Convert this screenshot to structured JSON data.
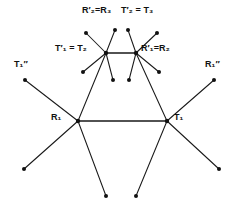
{
  "figure": {
    "background_color": "#ffffff",
    "line_color": "#1a1a1a",
    "node_color": "#111111",
    "width": 239,
    "height": 204
  },
  "labels": {
    "top_left": {
      "base": "R",
      "sub": "2",
      "prime": "′",
      "relation": "=",
      "rhs_base": "R",
      "rhs_sub": "3",
      "text": "R′₂=R₃"
    },
    "top_right": {
      "base": "T",
      "sub": "2",
      "prime": "′",
      "relation": "=",
      "rhs_base": "T",
      "rhs_sub": "3",
      "text": "T′₂ = T₃"
    },
    "mid_left": {
      "base": "T",
      "sub": "1",
      "prime": "′",
      "relation": "=",
      "rhs_base": "T",
      "rhs_sub": "2",
      "text": "T′₁ = T₂"
    },
    "mid_right": {
      "base": "R",
      "sub": "1",
      "prime": "′",
      "relation": "=",
      "rhs_base": "R",
      "rhs_sub": "2",
      "text": "R′₁=R₂"
    },
    "far_left": {
      "base": "T",
      "sub": "1",
      "prime": "″",
      "text": "T₁″"
    },
    "far_right": {
      "base": "R",
      "sub": "1",
      "prime": "″",
      "text": "R₁″"
    },
    "lower_left": {
      "base": "R",
      "sub": "1",
      "prime": "",
      "text": "R₁"
    },
    "lower_right": {
      "base": "T",
      "sub": "1",
      "prime": "",
      "text": "T₁"
    }
  },
  "chart_data": {
    "type": "diagram",
    "hubs": [
      {
        "id": "hub-upper-left",
        "x": 106,
        "y": 53,
        "label": "T′₁ = T₂"
      },
      {
        "id": "hub-upper-right",
        "x": 136,
        "y": 53,
        "label": "R′₁=R₂"
      },
      {
        "id": "hub-lower-left",
        "x": 78,
        "y": 121,
        "label": "R₁"
      },
      {
        "id": "hub-lower-right",
        "x": 167,
        "y": 121,
        "label": "T₁"
      }
    ],
    "leaves": [
      {
        "id": "leaf-ul-nw",
        "x": 86,
        "y": 33,
        "hub": "hub-upper-left"
      },
      {
        "id": "leaf-ul-n",
        "x": 115,
        "y": 30,
        "hub": "hub-upper-left"
      },
      {
        "id": "leaf-ul-sw",
        "x": 83,
        "y": 72,
        "hub": "hub-upper-left"
      },
      {
        "id": "leaf-ul-s",
        "x": 113,
        "y": 80,
        "hub": "hub-upper-left"
      },
      {
        "id": "leaf-ur-n",
        "x": 128,
        "y": 30,
        "hub": "hub-upper-right"
      },
      {
        "id": "leaf-ur-ne",
        "x": 157,
        "y": 33,
        "hub": "hub-upper-right"
      },
      {
        "id": "leaf-ur-s",
        "x": 129,
        "y": 80,
        "hub": "hub-upper-right"
      },
      {
        "id": "leaf-ur-se",
        "x": 159,
        "y": 72,
        "hub": "hub-upper-right"
      },
      {
        "id": "leaf-ll-nw",
        "x": 25,
        "y": 80,
        "hub": "hub-lower-left",
        "label": "T₁″"
      },
      {
        "id": "leaf-ll-sw",
        "x": 24,
        "y": 169,
        "hub": "hub-lower-left"
      },
      {
        "id": "leaf-ll-s",
        "x": 106,
        "y": 196,
        "hub": "hub-lower-left"
      },
      {
        "id": "leaf-lr-ne",
        "x": 214,
        "y": 80,
        "hub": "hub-lower-right",
        "label": "R₁″"
      },
      {
        "id": "leaf-lr-se",
        "x": 219,
        "y": 169,
        "hub": "hub-lower-right"
      },
      {
        "id": "leaf-lr-s",
        "x": 136,
        "y": 196,
        "hub": "hub-lower-right"
      }
    ],
    "edges": [
      {
        "from": "hub-upper-left",
        "to": "hub-upper-right",
        "kind": "spine"
      },
      {
        "from": "hub-lower-left",
        "to": "hub-lower-right",
        "kind": "spine"
      },
      {
        "from": "hub-lower-left",
        "to": "hub-upper-left",
        "kind": "normal"
      },
      {
        "from": "hub-lower-right",
        "to": "hub-upper-right",
        "kind": "normal"
      },
      {
        "from": "hub-upper-left",
        "to": "leaf-ul-nw",
        "kind": "normal"
      },
      {
        "from": "hub-upper-left",
        "to": "leaf-ul-n",
        "kind": "normal"
      },
      {
        "from": "hub-upper-left",
        "to": "leaf-ul-sw",
        "kind": "normal"
      },
      {
        "from": "hub-upper-left",
        "to": "leaf-ul-s",
        "kind": "normal"
      },
      {
        "from": "hub-upper-right",
        "to": "leaf-ur-n",
        "kind": "normal"
      },
      {
        "from": "hub-upper-right",
        "to": "leaf-ur-ne",
        "kind": "normal"
      },
      {
        "from": "hub-upper-right",
        "to": "leaf-ur-s",
        "kind": "normal"
      },
      {
        "from": "hub-upper-right",
        "to": "leaf-ur-se",
        "kind": "normal"
      },
      {
        "from": "hub-lower-left",
        "to": "leaf-ll-nw",
        "kind": "normal"
      },
      {
        "from": "hub-lower-left",
        "to": "leaf-ll-sw",
        "kind": "normal"
      },
      {
        "from": "hub-lower-left",
        "to": "leaf-ll-s",
        "kind": "normal"
      },
      {
        "from": "hub-lower-right",
        "to": "leaf-lr-ne",
        "kind": "normal"
      },
      {
        "from": "hub-lower-right",
        "to": "leaf-lr-se",
        "kind": "normal"
      },
      {
        "from": "hub-lower-right",
        "to": "leaf-lr-s",
        "kind": "normal"
      }
    ],
    "hub_radius": 2.2,
    "leaf_radius": 2.0
  }
}
